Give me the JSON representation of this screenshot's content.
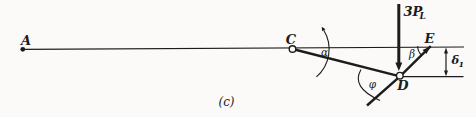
{
  "figure": {
    "caption": "(c)",
    "colors": {
      "paper": "#fbfaf8",
      "ink": "#1c1c1c"
    },
    "labels": {
      "point_a": "A",
      "point_c": "C",
      "point_d": "D",
      "point_e": "E",
      "force_main": "3P",
      "force_sub": "L",
      "angle_alpha": "α",
      "angle_beta": "β",
      "angle_phi": "φ",
      "dim_delta": "δ",
      "dim_sub": "1"
    }
  }
}
